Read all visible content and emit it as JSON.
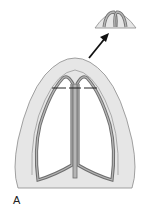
{
  "figure": {
    "panel_label": "A",
    "colors": {
      "skin": "#e6e6e6",
      "skin_outline": "#8c8c8c",
      "cartilage": "#a9a9a9",
      "cartilage_outline": "#6e6e6e",
      "inner_fill": "#ffffff",
      "arrow": "#111111",
      "marker_lines": "#222222"
    }
  }
}
